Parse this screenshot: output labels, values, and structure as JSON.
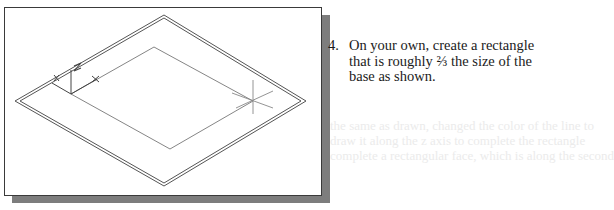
{
  "background_ghost_text": [
    "the same as drawn, changed the color of the line to",
    "draw it along the z axis to complete the rectangle",
    "complete a rectangular face, which is along the second"
  ],
  "figure": {
    "axis_labels": {
      "z": "Z",
      "x": "X"
    },
    "colors": {
      "frame_border": "#3a3a3a",
      "shadow": "#7d7d7d",
      "lines": "#555555"
    }
  },
  "instruction": {
    "number": "4.",
    "lines": [
      "On your own, create a rectangle",
      "that is roughly ⅔ the size of the",
      "base as shown."
    ]
  }
}
